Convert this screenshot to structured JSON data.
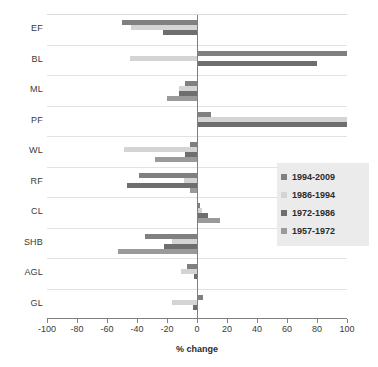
{
  "chart_data": {
    "type": "bar",
    "orientation": "horizontal",
    "title": "",
    "xlabel": "% change",
    "ylabel": "",
    "xlim": [
      -100,
      100
    ],
    "xticks": [
      -100,
      -80,
      -60,
      -40,
      -20,
      0,
      20,
      40,
      60,
      80,
      100
    ],
    "xtick_labels": [
      "-100",
      "-80",
      "-60",
      "-40",
      "-20",
      "0",
      "20",
      "40",
      "60",
      "80",
      "100"
    ],
    "grid": false,
    "legend_position": "center-right",
    "categories": [
      "EF",
      "BL",
      "ML",
      "PF",
      "WL",
      "RF",
      "CL",
      "SHB",
      "AGL",
      "GL"
    ],
    "series": [
      {
        "name": "1994-2009",
        "color": "#808080",
        "values": [
          -50,
          100,
          -8,
          9,
          -5,
          -39,
          2,
          -35,
          -7,
          4
        ]
      },
      {
        "name": "1986-1994",
        "color": "#d4d4d4",
        "values": [
          -44,
          -45,
          -12,
          100,
          -49,
          -9,
          3,
          -17,
          -11,
          -17
        ]
      },
      {
        "name": "1972-1986",
        "color": "#6e6e6e",
        "values": [
          -23,
          80,
          -12,
          100,
          -8,
          -47,
          7,
          -22,
          -2,
          -3
        ]
      },
      {
        "name": "1957-1972",
        "color": "#9a9a9a",
        "values": [
          0,
          0,
          -20,
          0,
          -28,
          -5,
          15,
          -53,
          0,
          0
        ]
      }
    ]
  },
  "legend": {
    "items": [
      {
        "label": "1994-2009",
        "color": "#808080"
      },
      {
        "label": "1986-1994",
        "color": "#d4d4d4"
      },
      {
        "label": "1972-1986",
        "color": "#6e6e6e"
      },
      {
        "label": "1957-1972",
        "color": "#9a9a9a"
      }
    ]
  }
}
